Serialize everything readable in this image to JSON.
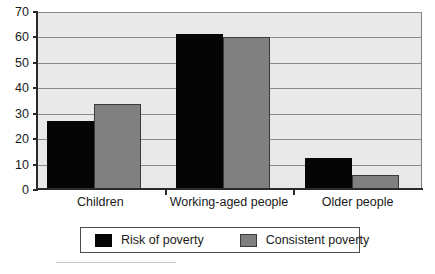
{
  "chart_data": {
    "type": "bar",
    "title": "",
    "subtitle": "",
    "xlabel": "",
    "ylabel": "",
    "categories": [
      "Children",
      "Working-aged people",
      "Older people"
    ],
    "series": [
      {
        "name": "Risk of poverty",
        "color": "#050505",
        "values": [
          27,
          61.5,
          12.5
        ]
      },
      {
        "name": "Consistent poverty",
        "color": "#808080",
        "values": [
          34,
          60,
          6
        ]
      }
    ],
    "ylim": [
      0,
      70
    ],
    "ytick_step": 10,
    "yticks": [
      70,
      60,
      50,
      40,
      30,
      20,
      10,
      0
    ],
    "ytick_labels": [
      "70",
      "60",
      "50",
      "40",
      "30",
      "20",
      "10",
      "0"
    ],
    "grid": "horizontal",
    "grid_color": "#8a8a8a",
    "plot_background": "#e9e9e9",
    "axis_color": "#2a2a2a",
    "legend_position": "below-center",
    "legend_border": true,
    "annotations": []
  }
}
